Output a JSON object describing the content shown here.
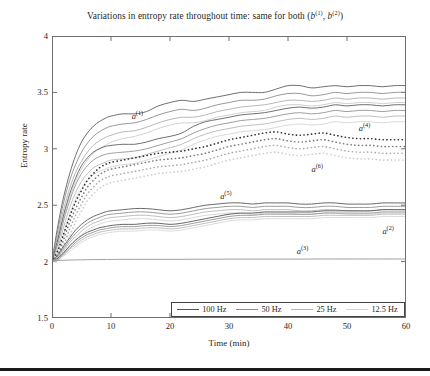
{
  "chart_data": {
    "type": "line",
    "title_plain": "Variations in entropy rate throughout time: same for both (b(1), b(2))",
    "xlabel": "Time (min)",
    "ylabel": "Entropy rate",
    "xlim": [
      0,
      60
    ],
    "ylim": [
      1.5,
      4
    ],
    "xticks": [
      0,
      10,
      20,
      30,
      40,
      50,
      60
    ],
    "yticks": [
      1.5,
      2,
      2.5,
      3,
      3.5,
      4
    ],
    "xtick_labels": [
      "0",
      "10",
      "20",
      "30",
      "40",
      "50",
      "60"
    ],
    "ytick_labels": [
      "1.5",
      "2",
      "2.5",
      "3",
      "3.5",
      "4"
    ],
    "grid": false,
    "legend_position": "bottom-inside-right",
    "x": [
      0,
      1,
      2,
      3,
      4,
      5,
      6,
      7,
      8,
      9,
      10,
      12,
      14,
      16,
      18,
      20,
      22,
      24,
      26,
      28,
      30,
      32,
      34,
      36,
      38,
      40,
      42,
      44,
      46,
      48,
      50,
      52,
      54,
      56,
      58,
      60
    ],
    "series": [
      {
        "name": "a(1) 100 Hz",
        "annotation": "a(1)",
        "freq": "100 Hz",
        "color": "#555555",
        "style": "solid",
        "values": [
          2.0,
          2.32,
          2.58,
          2.78,
          2.94,
          3.06,
          3.14,
          3.2,
          3.24,
          3.27,
          3.29,
          3.31,
          3.31,
          3.33,
          3.38,
          3.41,
          3.43,
          3.42,
          3.44,
          3.46,
          3.48,
          3.5,
          3.5,
          3.5,
          3.53,
          3.56,
          3.56,
          3.54,
          3.55,
          3.56,
          3.55,
          3.56,
          3.56,
          3.55,
          3.56,
          3.56
        ]
      },
      {
        "name": "a(1) 50 Hz",
        "freq": "50 Hz",
        "color": "#858585",
        "style": "solid",
        "values": [
          2.0,
          2.28,
          2.53,
          2.72,
          2.86,
          2.97,
          3.05,
          3.11,
          3.15,
          3.18,
          3.2,
          3.22,
          3.23,
          3.26,
          3.3,
          3.33,
          3.35,
          3.34,
          3.36,
          3.39,
          3.41,
          3.43,
          3.43,
          3.44,
          3.47,
          3.49,
          3.49,
          3.47,
          3.48,
          3.5,
          3.49,
          3.5,
          3.5,
          3.49,
          3.5,
          3.5
        ]
      },
      {
        "name": "a(1) 25 Hz",
        "freq": "25 Hz",
        "color": "#aaaaaa",
        "style": "solid",
        "values": [
          2.0,
          2.24,
          2.47,
          2.65,
          2.79,
          2.89,
          2.97,
          3.03,
          3.07,
          3.1,
          3.12,
          3.15,
          3.16,
          3.19,
          3.23,
          3.26,
          3.28,
          3.28,
          3.3,
          3.33,
          3.35,
          3.37,
          3.38,
          3.39,
          3.41,
          3.43,
          3.43,
          3.42,
          3.43,
          3.45,
          3.44,
          3.45,
          3.45,
          3.44,
          3.45,
          3.45
        ]
      },
      {
        "name": "a(1) 12.5 Hz",
        "freq": "12.5 Hz",
        "color": "#c9c9c9",
        "style": "solid",
        "values": [
          2.0,
          2.19,
          2.4,
          2.57,
          2.71,
          2.82,
          2.9,
          2.96,
          3.0,
          3.03,
          3.06,
          3.09,
          3.11,
          3.14,
          3.18,
          3.21,
          3.23,
          3.23,
          3.25,
          3.28,
          3.3,
          3.32,
          3.33,
          3.34,
          3.37,
          3.39,
          3.39,
          3.38,
          3.39,
          3.41,
          3.4,
          3.41,
          3.41,
          3.4,
          3.41,
          3.41
        ]
      },
      {
        "name": "a(4) 100 Hz",
        "annotation": "a(4)",
        "freq": "100 Hz",
        "color": "#555555",
        "style": "solid",
        "values": [
          2.0,
          2.2,
          2.42,
          2.6,
          2.74,
          2.85,
          2.92,
          2.97,
          3.0,
          3.02,
          3.03,
          3.04,
          3.04,
          3.06,
          3.09,
          3.11,
          3.14,
          3.2,
          3.24,
          3.26,
          3.28,
          3.3,
          3.31,
          3.32,
          3.34,
          3.36,
          3.37,
          3.36,
          3.37,
          3.39,
          3.38,
          3.39,
          3.39,
          3.38,
          3.39,
          3.39
        ]
      },
      {
        "name": "a(4) 50 Hz",
        "freq": "50 Hz",
        "color": "#8e8e8e",
        "style": "solid",
        "values": [
          2.0,
          2.16,
          2.37,
          2.54,
          2.68,
          2.78,
          2.85,
          2.9,
          2.93,
          2.95,
          2.96,
          2.97,
          2.98,
          3.0,
          3.03,
          3.06,
          3.09,
          3.14,
          3.18,
          3.21,
          3.23,
          3.25,
          3.26,
          3.27,
          3.29,
          3.31,
          3.32,
          3.31,
          3.32,
          3.34,
          3.33,
          3.34,
          3.34,
          3.33,
          3.34,
          3.34
        ]
      },
      {
        "name": "a(4) 25 Hz",
        "freq": "25 Hz",
        "color": "#b4b4b4",
        "style": "solid",
        "values": [
          2.0,
          2.12,
          2.31,
          2.48,
          2.61,
          2.71,
          2.78,
          2.83,
          2.86,
          2.88,
          2.9,
          2.91,
          2.92,
          2.95,
          2.98,
          3.01,
          3.04,
          3.09,
          3.13,
          3.16,
          3.18,
          3.2,
          3.21,
          3.22,
          3.24,
          3.26,
          3.27,
          3.26,
          3.27,
          3.29,
          3.28,
          3.29,
          3.29,
          3.28,
          3.29,
          3.29
        ]
      },
      {
        "name": "a(4) 12.5 Hz",
        "freq": "12.5 Hz",
        "color": "#d2d2d2",
        "style": "solid",
        "values": [
          2.0,
          2.08,
          2.25,
          2.42,
          2.55,
          2.65,
          2.72,
          2.77,
          2.8,
          2.82,
          2.84,
          2.86,
          2.87,
          2.9,
          2.93,
          2.96,
          2.99,
          3.04,
          3.08,
          3.11,
          3.13,
          3.15,
          3.16,
          3.17,
          3.19,
          3.21,
          3.22,
          3.21,
          3.22,
          3.24,
          3.23,
          3.24,
          3.24,
          3.23,
          3.24,
          3.24
        ]
      },
      {
        "name": "a(6) 100 Hz",
        "annotation": "a(6)",
        "freq": "100 Hz",
        "color": "#303030",
        "style": "dotted",
        "values": [
          2.0,
          2.1,
          2.25,
          2.4,
          2.53,
          2.63,
          2.72,
          2.78,
          2.83,
          2.86,
          2.88,
          2.9,
          2.92,
          2.94,
          2.96,
          2.97,
          2.98,
          3.0,
          3.02,
          3.05,
          3.08,
          3.1,
          3.12,
          3.14,
          3.15,
          3.13,
          3.12,
          3.13,
          3.14,
          3.12,
          3.1,
          3.09,
          3.09,
          3.08,
          3.08,
          3.08
        ]
      },
      {
        "name": "a(6) 50 Hz",
        "freq": "50 Hz",
        "color": "#7b7b7b",
        "style": "dotted",
        "values": [
          2.0,
          2.06,
          2.2,
          2.35,
          2.47,
          2.57,
          2.66,
          2.72,
          2.77,
          2.8,
          2.82,
          2.84,
          2.86,
          2.88,
          2.9,
          2.91,
          2.92,
          2.94,
          2.96,
          2.99,
          3.02,
          3.04,
          3.06,
          3.08,
          3.09,
          3.07,
          3.06,
          3.07,
          3.08,
          3.06,
          3.04,
          3.03,
          3.03,
          3.02,
          3.02,
          3.02
        ]
      },
      {
        "name": "a(6) 25 Hz",
        "freq": "25 Hz",
        "color": "#acacac",
        "style": "dotted",
        "values": [
          2.0,
          2.03,
          2.15,
          2.29,
          2.41,
          2.51,
          2.6,
          2.66,
          2.71,
          2.74,
          2.76,
          2.78,
          2.8,
          2.82,
          2.84,
          2.85,
          2.86,
          2.88,
          2.9,
          2.93,
          2.96,
          2.98,
          3.0,
          3.02,
          3.03,
          3.01,
          3.0,
          3.01,
          3.02,
          3.0,
          2.98,
          2.97,
          2.97,
          2.96,
          2.96,
          2.96
        ]
      },
      {
        "name": "a(6) 12.5 Hz",
        "freq": "12.5 Hz",
        "color": "#cdcdcd",
        "style": "dotted",
        "values": [
          2.0,
          2.01,
          2.1,
          2.23,
          2.35,
          2.45,
          2.54,
          2.6,
          2.65,
          2.68,
          2.7,
          2.72,
          2.74,
          2.76,
          2.78,
          2.79,
          2.8,
          2.82,
          2.84,
          2.87,
          2.9,
          2.92,
          2.94,
          2.96,
          2.97,
          2.95,
          2.94,
          2.95,
          2.96,
          2.94,
          2.92,
          2.91,
          2.91,
          2.9,
          2.9,
          2.9
        ]
      },
      {
        "name": "a(5) 100 Hz",
        "annotation": "a(5)",
        "freq": "100 Hz",
        "color": "#4f4f4f",
        "style": "solid",
        "values": [
          2.0,
          2.06,
          2.14,
          2.21,
          2.28,
          2.33,
          2.37,
          2.4,
          2.42,
          2.44,
          2.45,
          2.46,
          2.47,
          2.47,
          2.46,
          2.45,
          2.46,
          2.48,
          2.5,
          2.51,
          2.52,
          2.52,
          2.51,
          2.52,
          2.52,
          2.52,
          2.51,
          2.51,
          2.52,
          2.52,
          2.51,
          2.51,
          2.51,
          2.52,
          2.52,
          2.52
        ]
      },
      {
        "name": "a(5) 50 Hz",
        "freq": "50 Hz",
        "color": "#8a8a8a",
        "style": "solid",
        "values": [
          2.0,
          2.05,
          2.12,
          2.19,
          2.25,
          2.3,
          2.34,
          2.37,
          2.39,
          2.41,
          2.42,
          2.43,
          2.44,
          2.44,
          2.43,
          2.42,
          2.43,
          2.45,
          2.47,
          2.48,
          2.49,
          2.49,
          2.48,
          2.49,
          2.49,
          2.49,
          2.48,
          2.48,
          2.49,
          2.49,
          2.48,
          2.48,
          2.48,
          2.49,
          2.49,
          2.49
        ]
      },
      {
        "name": "a(5) 25 Hz",
        "freq": "25 Hz",
        "color": "#b2b2b2",
        "style": "solid",
        "values": [
          2.0,
          2.04,
          2.1,
          2.17,
          2.22,
          2.27,
          2.31,
          2.34,
          2.36,
          2.38,
          2.39,
          2.4,
          2.41,
          2.41,
          2.4,
          2.39,
          2.4,
          2.42,
          2.44,
          2.45,
          2.46,
          2.46,
          2.45,
          2.46,
          2.46,
          2.46,
          2.45,
          2.45,
          2.46,
          2.46,
          2.45,
          2.45,
          2.45,
          2.46,
          2.46,
          2.46
        ]
      },
      {
        "name": "a(5) 12.5 Hz",
        "freq": "12.5 Hz",
        "color": "#d0d0d0",
        "style": "solid",
        "values": [
          2.0,
          2.03,
          2.08,
          2.14,
          2.19,
          2.24,
          2.28,
          2.31,
          2.33,
          2.35,
          2.36,
          2.37,
          2.38,
          2.38,
          2.37,
          2.36,
          2.37,
          2.39,
          2.41,
          2.42,
          2.43,
          2.43,
          2.42,
          2.43,
          2.43,
          2.43,
          2.42,
          2.42,
          2.43,
          2.43,
          2.42,
          2.42,
          2.42,
          2.43,
          2.43,
          2.43
        ]
      },
      {
        "name": "a(2) 100 Hz",
        "annotation": "a(2)",
        "freq": "100 Hz",
        "color": "#4a4a4a",
        "style": "solid",
        "values": [
          2.0,
          2.03,
          2.08,
          2.14,
          2.19,
          2.23,
          2.26,
          2.28,
          2.3,
          2.31,
          2.32,
          2.33,
          2.33,
          2.34,
          2.34,
          2.33,
          2.34,
          2.36,
          2.38,
          2.4,
          2.42,
          2.43,
          2.43,
          2.44,
          2.44,
          2.44,
          2.44,
          2.44,
          2.45,
          2.45,
          2.45,
          2.45,
          2.45,
          2.46,
          2.46,
          2.46
        ]
      },
      {
        "name": "a(2) 50 Hz",
        "freq": "50 Hz",
        "color": "#8d8d8d",
        "style": "solid",
        "values": [
          2.0,
          2.02,
          2.07,
          2.12,
          2.17,
          2.21,
          2.24,
          2.26,
          2.28,
          2.29,
          2.3,
          2.31,
          2.31,
          2.32,
          2.32,
          2.31,
          2.32,
          2.34,
          2.36,
          2.38,
          2.4,
          2.41,
          2.41,
          2.42,
          2.42,
          2.42,
          2.42,
          2.42,
          2.43,
          2.43,
          2.43,
          2.43,
          2.43,
          2.44,
          2.44,
          2.44
        ]
      },
      {
        "name": "a(2) 25 Hz",
        "freq": "25 Hz",
        "color": "#b5b5b5",
        "style": "solid",
        "values": [
          2.0,
          2.02,
          2.06,
          2.11,
          2.15,
          2.19,
          2.22,
          2.24,
          2.26,
          2.27,
          2.28,
          2.29,
          2.29,
          2.3,
          2.3,
          2.29,
          2.3,
          2.32,
          2.34,
          2.36,
          2.38,
          2.39,
          2.39,
          2.4,
          2.4,
          2.4,
          2.4,
          2.4,
          2.41,
          2.41,
          2.41,
          2.41,
          2.41,
          2.42,
          2.42,
          2.42
        ]
      },
      {
        "name": "a(2) 12.5 Hz",
        "freq": "12.5 Hz",
        "color": "#d4d4d4",
        "style": "solid",
        "values": [
          2.0,
          2.01,
          2.05,
          2.09,
          2.13,
          2.17,
          2.2,
          2.22,
          2.24,
          2.25,
          2.26,
          2.27,
          2.27,
          2.28,
          2.28,
          2.27,
          2.28,
          2.3,
          2.32,
          2.34,
          2.36,
          2.37,
          2.37,
          2.38,
          2.38,
          2.38,
          2.38,
          2.38,
          2.39,
          2.39,
          2.39,
          2.39,
          2.39,
          2.4,
          2.4,
          2.4
        ]
      },
      {
        "name": "a(3) 100 Hz",
        "annotation": "a(3)",
        "freq": "100 Hz",
        "color": "#8f8f8f",
        "style": "solid",
        "values": [
          2.0,
          2.01,
          2.012,
          2.014,
          2.015,
          2.016,
          2.017,
          2.018,
          2.018,
          2.019,
          2.019,
          2.02,
          2.02,
          2.02,
          2.02,
          2.02,
          2.02,
          2.021,
          2.021,
          2.021,
          2.022,
          2.022,
          2.022,
          2.022,
          2.022,
          2.022,
          2.022,
          2.023,
          2.023,
          2.023,
          2.023,
          2.023,
          2.023,
          2.023,
          2.023,
          2.023
        ]
      }
    ],
    "annotations": [
      {
        "label": "a(1)",
        "label_base": "a",
        "label_sup": "(1)",
        "x": 13.5,
        "y": 3.33
      },
      {
        "label": "a(4)",
        "label_base": "a",
        "label_sup": "(4)",
        "x": 52.0,
        "y": 3.22
      },
      {
        "label": "a(6)",
        "label_base": "a",
        "label_sup": "(6)",
        "x": 44.0,
        "y": 2.86
      },
      {
        "label": "a(5)",
        "label_base": "a",
        "label_sup": "(5)",
        "x": 28.5,
        "y": 2.62
      },
      {
        "label": "a(2)",
        "label_base": "a",
        "label_sup": "(2)",
        "x": 56.0,
        "y": 2.31
      },
      {
        "label": "a(3)",
        "label_base": "a",
        "label_sup": "(3)",
        "x": 41.5,
        "y": 2.13
      }
    ],
    "legend": [
      {
        "label": "100 Hz",
        "color": "#555555"
      },
      {
        "label": "50 Hz",
        "color": "#8d8d8d"
      },
      {
        "label": "25 Hz",
        "color": "#b5b5b5"
      },
      {
        "label": "12.5 Hz",
        "color": "#d4d4d4"
      }
    ]
  }
}
